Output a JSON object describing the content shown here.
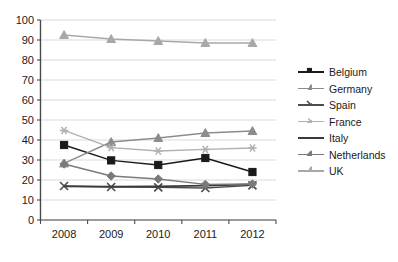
{
  "chart_data": {
    "type": "line",
    "title": "",
    "xlabel": "",
    "ylabel": "",
    "x": [
      "2008",
      "2009",
      "2010",
      "2011",
      "2012"
    ],
    "ylim": [
      0,
      100
    ],
    "ytick_step": 10,
    "yticks": [
      "0",
      "10",
      "20",
      "30",
      "40",
      "50",
      "60",
      "70",
      "80",
      "90",
      "100"
    ],
    "grid": true,
    "grid_axis": "y",
    "legend_position": "right",
    "series": [
      {
        "name": "Belgium",
        "marker": "square",
        "color": "#1a1a1a",
        "values": [
          37.5,
          29.8,
          27.5,
          31.0,
          24.0
        ]
      },
      {
        "name": "Germany",
        "marker": "triangle",
        "color": "#8c8c8c",
        "values": [
          28.3,
          39.0,
          41.0,
          43.5,
          44.5
        ]
      },
      {
        "name": "Spain",
        "marker": "x",
        "color": "#4d4d4d",
        "values": [
          17.0,
          16.5,
          16.3,
          16.0,
          17.3
        ]
      },
      {
        "name": "France",
        "marker": "asterisk",
        "color": "#b0b0b0",
        "values": [
          44.8,
          36.2,
          34.5,
          35.3,
          36.0
        ]
      },
      {
        "name": "Italy",
        "marker": "none",
        "color": "#3a3a3a",
        "values": [
          16.8,
          16.7,
          16.8,
          17.2,
          17.8
        ]
      },
      {
        "name": "Netherlands",
        "marker": "diamond",
        "color": "#7a7a7a",
        "values": [
          28.0,
          22.0,
          20.5,
          17.8,
          18.0
        ]
      },
      {
        "name": "UK",
        "marker": "triangle",
        "color": "#a8a8a8",
        "values": [
          92.5,
          90.5,
          89.5,
          88.5,
          88.5
        ]
      }
    ]
  },
  "axis": {
    "y_labels": [
      "100",
      "90",
      "80",
      "70",
      "60",
      "50",
      "40",
      "30",
      "20",
      "10",
      "0"
    ],
    "x_labels": [
      "2008",
      "2009",
      "2010",
      "2011",
      "2012"
    ]
  },
  "legend": {
    "items": [
      {
        "label": "Belgium"
      },
      {
        "label": "Germany"
      },
      {
        "label": "Spain"
      },
      {
        "label": "France"
      },
      {
        "label": "Italy"
      },
      {
        "label": "Netherlands"
      },
      {
        "label": "UK"
      }
    ]
  },
  "colors": {
    "axis": "#4a4a4a",
    "grid": "#d9d9d9",
    "text": "#1a1a1a",
    "background": "#ffffff"
  }
}
